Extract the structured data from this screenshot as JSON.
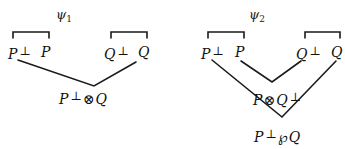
{
  "proofs": [
    {
      "name": "psi1",
      "title": {
        "base": "ψ",
        "sub": "1"
      },
      "axioms": [
        {
          "left": "P",
          "left_perp": "⊥",
          "right": "P"
        },
        {
          "left": "Q",
          "left_perp": "⊥",
          "right": "Q"
        }
      ],
      "conclusion": {
        "a": "P",
        "a_perp": "⊥",
        "op": "⊗",
        "b": "Q",
        "b_perp": ""
      }
    },
    {
      "name": "psi2",
      "title": {
        "base": "ψ",
        "sub": "2"
      },
      "axioms": [
        {
          "left": "P",
          "left_perp": "⊥",
          "right": "P"
        },
        {
          "left": "Q",
          "left_perp": "⊥",
          "right": "Q"
        }
      ],
      "intermediate": {
        "a": "P",
        "op": "⊗",
        "b": "Q",
        "b_perp": "⊥"
      },
      "conclusion": {
        "a": "P",
        "a_perp": "⊥",
        "op": "℘",
        "b": "Q"
      }
    }
  ],
  "colors": {
    "line": "#1a1a1a",
    "text": "#111111"
  }
}
